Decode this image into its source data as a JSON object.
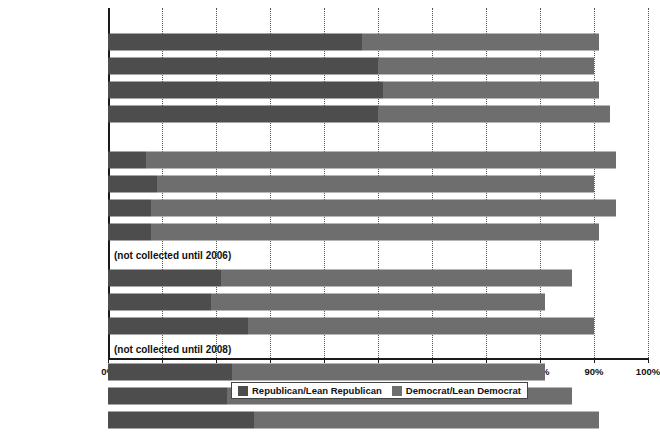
{
  "chart_data": {
    "type": "bar",
    "orientation": "horizontal",
    "stacked": true,
    "title": "",
    "xlabel": "",
    "ylabel": "",
    "xlim": [
      0,
      100
    ],
    "xticks": [
      "0%",
      "10%",
      "20%",
      "30%",
      "40%",
      "50%",
      "60%",
      "70%",
      "80%",
      "90%",
      "100%"
    ],
    "xtick_values": [
      0,
      10,
      20,
      30,
      40,
      50,
      60,
      70,
      80,
      90,
      100
    ],
    "grid": true,
    "grid_axis": "x",
    "legend_position": "bottom",
    "legend": [
      "Republican/Lean Republican",
      "Democrat/Lean Democrat"
    ],
    "series": [
      {
        "name": "Republican/Lean Republican",
        "color": "#4d4d4d"
      },
      {
        "name": "Democrat/Lean Democrat",
        "color": "#6e6e6e"
      }
    ],
    "groups": [
      {
        "label": "White, Non-Hispanic",
        "note": "",
        "rows": [
          {
            "category": "1992",
            "republican": 47,
            "democrat": 44,
            "total": 91
          },
          {
            "category": "2002",
            "republican": 50,
            "democrat": 40,
            "total": 90
          },
          {
            "category": "2012",
            "republican": 51,
            "democrat": 40,
            "total": 91
          },
          {
            "category": "2017",
            "republican": 50,
            "democrat": 43,
            "total": 93
          }
        ]
      },
      {
        "label": "Black",
        "note": "",
        "rows": [
          {
            "category": "1992",
            "republican": 7,
            "democrat": 87,
            "total": 94
          },
          {
            "category": "2002",
            "republican": 9,
            "democrat": 81,
            "total": 90
          },
          {
            "category": "2012",
            "republican": 8,
            "democrat": 86,
            "total": 94
          },
          {
            "category": "2017",
            "republican": 8,
            "democrat": 83,
            "total": 91
          }
        ]
      },
      {
        "label": "Hispanic",
        "note": "(not collected until 2006)",
        "rows": [
          {
            "category": "2008",
            "republican": 21,
            "democrat": 65,
            "total": 86
          },
          {
            "category": "2014",
            "republican": 19,
            "democrat": 62,
            "total": 81
          },
          {
            "category": "2017",
            "republican": 26,
            "democrat": 64,
            "total": 90
          }
        ]
      },
      {
        "label": "Asian, Non-Hispanic,\nEnglish-speaking only",
        "label_line1": "Asian, Non-Hispanic,",
        "label_line2": "English-speaking only",
        "note": "(not collected until 2008)",
        "rows": [
          {
            "category": "2008",
            "republican": 23,
            "democrat": 58,
            "total": 81
          },
          {
            "category": "2014",
            "republican": 22,
            "democrat": 64,
            "total": 86
          },
          {
            "category": "2017",
            "republican": 27,
            "democrat": 64,
            "total": 91
          }
        ]
      }
    ]
  },
  "colors": {
    "republican": "#4d4d4d",
    "democrat": "#6e6e6e",
    "axis": "#1a1a1a",
    "grid": "#555555",
    "background": "#ffffff"
  }
}
